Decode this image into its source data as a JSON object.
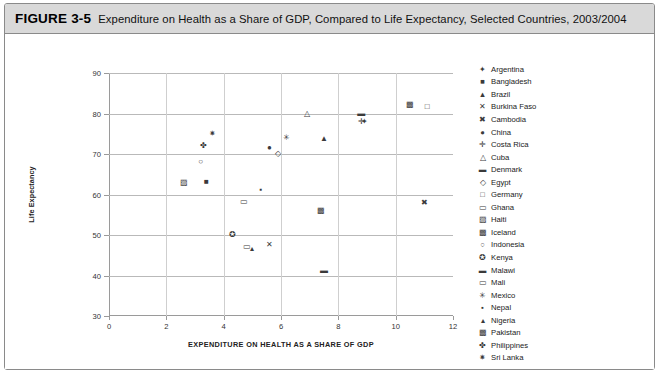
{
  "figure": {
    "number": "FIGURE 3-5",
    "title": "Expenditure on Health as a Share of GDP, Compared to Life Expectancy, Selected Countries, 2003/2004"
  },
  "chart_data": {
    "type": "scatter",
    "title": "Expenditure on Health as a Share of GDP, Compared to Life Expectancy, Selected Countries, 2003/2004",
    "xlabel": "EXPENDITURE ON HEALTH AS A SHARE OF GDP",
    "ylabel": "Life Expectancy",
    "xlim": [
      0,
      12
    ],
    "ylim": [
      30,
      90
    ],
    "xticks": [
      "0",
      "2",
      "4",
      "6",
      "8",
      "10",
      "12"
    ],
    "yticks": [
      "30",
      "40",
      "50",
      "60",
      "70",
      "80",
      "90"
    ],
    "grid": "both",
    "legend_position": "right",
    "series": [
      {
        "name": "Argentina",
        "marker": "✦",
        "x": 8.9,
        "y": 77.8
      },
      {
        "name": "Bangladesh",
        "marker": "■",
        "x": 3.4,
        "y": 63.0
      },
      {
        "name": "Brazil",
        "marker": "▲",
        "x": 7.5,
        "y": 73.8
      },
      {
        "name": "Burkina Faso",
        "marker": "✕",
        "x": 5.6,
        "y": 47.5
      },
      {
        "name": "Cambodia",
        "marker": "✖",
        "x": 11.0,
        "y": 57.8
      },
      {
        "name": "China",
        "marker": "●",
        "x": 5.6,
        "y": 71.5
      },
      {
        "name": "Costa Rica",
        "marker": "✛",
        "x": 8.8,
        "y": 77.8
      },
      {
        "name": "Cuba",
        "marker": "△",
        "x": 6.9,
        "y": 80.0
      },
      {
        "name": "Denmark",
        "marker": "▬",
        "x": 8.8,
        "y": 80.0
      },
      {
        "name": "Egypt",
        "marker": "◇",
        "x": 5.9,
        "y": 70.0
      },
      {
        "name": "Germany",
        "marker": "□",
        "x": 11.1,
        "y": 81.5
      },
      {
        "name": "Ghana",
        "marker": "▭",
        "x": 4.7,
        "y": 58.2
      },
      {
        "name": "Haiti",
        "marker": "▨",
        "x": 2.6,
        "y": 62.8
      },
      {
        "name": "Iceland",
        "marker": "▩",
        "x": 10.5,
        "y": 82.2
      },
      {
        "name": "Indonesia",
        "marker": "○",
        "x": 3.2,
        "y": 68.0
      },
      {
        "name": "Kenya",
        "marker": "✪",
        "x": 4.3,
        "y": 50.0
      },
      {
        "name": "Malawi",
        "marker": "▬",
        "x": 7.5,
        "y": 41.0
      },
      {
        "name": "Mali",
        "marker": "▭",
        "x": 4.8,
        "y": 47.0
      },
      {
        "name": "Mexico",
        "marker": "✳",
        "x": 6.2,
        "y": 74.0
      },
      {
        "name": "Nepal",
        "marker": "▪",
        "x": 5.3,
        "y": 61.0
      },
      {
        "name": "Nigeria",
        "marker": "▴",
        "x": 5.0,
        "y": 46.5
      },
      {
        "name": "Pakistan",
        "marker": "▩",
        "x": 7.4,
        "y": 56.0
      },
      {
        "name": "Philippines",
        "marker": "✤",
        "x": 3.3,
        "y": 72.0
      },
      {
        "name": "Sri Lanka",
        "marker": "✷",
        "x": 3.6,
        "y": 75.0
      }
    ],
    "legend_entries": [
      {
        "marker": "✦",
        "label": "Argentina"
      },
      {
        "marker": "■",
        "label": "Bangladesh"
      },
      {
        "marker": "▲",
        "label": "Brazil"
      },
      {
        "marker": "✕",
        "label": "Burkina Faso"
      },
      {
        "marker": "✖",
        "label": "Cambodia"
      },
      {
        "marker": "●",
        "label": "China"
      },
      {
        "marker": "✛",
        "label": "Costa Rica"
      },
      {
        "marker": "△",
        "label": "Cuba"
      },
      {
        "marker": "▬",
        "label": "Denmark"
      },
      {
        "marker": "◇",
        "label": "Egypt"
      },
      {
        "marker": "□",
        "label": "Germany"
      },
      {
        "marker": "▭",
        "label": "Ghana"
      },
      {
        "marker": "▨",
        "label": "Haiti"
      },
      {
        "marker": "▩",
        "label": "Iceland"
      },
      {
        "marker": "○",
        "label": "Indonesia"
      },
      {
        "marker": "✪",
        "label": "Kenya"
      },
      {
        "marker": "▬",
        "label": "Malawi"
      },
      {
        "marker": "▭",
        "label": "Mali"
      },
      {
        "marker": "✳",
        "label": "Mexico"
      },
      {
        "marker": "▪",
        "label": "Nepal"
      },
      {
        "marker": "▴",
        "label": "Nigeria"
      },
      {
        "marker": "▩",
        "label": "Pakistan"
      },
      {
        "marker": "✤",
        "label": "Philippines"
      },
      {
        "marker": "✷",
        "label": "Sri Lanka"
      }
    ]
  }
}
